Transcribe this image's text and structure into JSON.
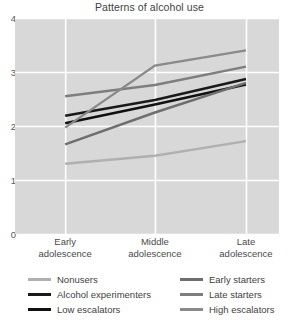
{
  "chart_data": {
    "type": "line",
    "title": "Patterns of alcohol use",
    "xlabel": "",
    "ylabel": "",
    "grid": true,
    "legend_position": "bottom",
    "categories": [
      "Early adolescence",
      "Middle adolescence",
      "Late adolescence"
    ],
    "category_lines": [
      {
        "l1": "Early",
        "l2": "adolescence"
      },
      {
        "l1": "Middle",
        "l2": "adolescence"
      },
      {
        "l1": "Late",
        "l2": "adolescence"
      }
    ],
    "ylim": [
      0,
      4
    ],
    "yticks": [
      0,
      1,
      2,
      3,
      4
    ],
    "ytick_labels": [
      "0",
      "1",
      "2",
      "3",
      "4"
    ],
    "series": [
      {
        "name": "Nonusers",
        "values": [
          1.3,
          1.45,
          1.72
        ],
        "color": "#b0b0b0",
        "width": 2.4
      },
      {
        "name": "Alcohol experimenters",
        "values": [
          2.19,
          2.48,
          2.87
        ],
        "color": "#1a1a1a",
        "width": 2.6
      },
      {
        "name": "Low escalators",
        "values": [
          2.05,
          2.4,
          2.77
        ],
        "color": "#111111",
        "width": 2.6
      },
      {
        "name": "Early starters",
        "values": [
          1.66,
          2.25,
          2.8
        ],
        "color": "#6e6e6e",
        "width": 2.4
      },
      {
        "name": "Late starters",
        "values": [
          2.55,
          2.76,
          3.1
        ],
        "color": "#7e7e7e",
        "width": 2.4
      },
      {
        "name": "High escalators",
        "values": [
          1.97,
          3.12,
          3.4
        ],
        "color": "#8a8a8a",
        "width": 2.4
      }
    ]
  },
  "legend": {
    "left": [
      {
        "label": "Nonusers",
        "color": "#b0b0b0"
      },
      {
        "label": "Alcohol experimenters",
        "color": "#1a1a1a"
      },
      {
        "label": "Low escalators",
        "color": "#111111"
      }
    ],
    "right": [
      {
        "label": "Early starters",
        "color": "#6e6e6e"
      },
      {
        "label": "Late starters",
        "color": "#7e7e7e"
      },
      {
        "label": "High escalators",
        "color": "#8a8a8a"
      }
    ]
  },
  "colors": {
    "plot_background": "#d8d8d8",
    "gridline": "#ffffff",
    "page_background": "#ffffff",
    "text": "#3f3f3f"
  }
}
